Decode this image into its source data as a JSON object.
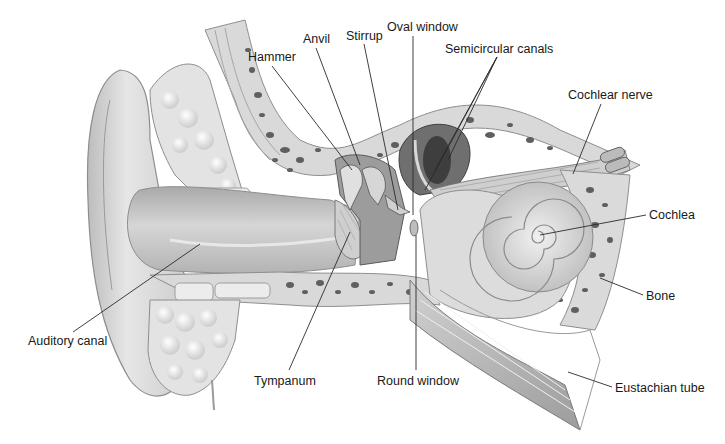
{
  "diagram": {
    "labels": [
      {
        "id": "hammer",
        "text": "Hammer",
        "x": 248,
        "y": 50,
        "line": [
          [
            272,
            66
          ],
          [
            352,
            170
          ]
        ]
      },
      {
        "id": "anvil",
        "text": "Anvil",
        "x": 303,
        "y": 32,
        "line": [
          [
            316,
            48
          ],
          [
            360,
            165
          ]
        ]
      },
      {
        "id": "stirrup",
        "text": "Stirrup",
        "x": 346,
        "y": 29,
        "line": [
          [
            364,
            44
          ],
          [
            398,
            210
          ]
        ]
      },
      {
        "id": "oval-window",
        "text": "Oval window",
        "x": 387,
        "y": 20,
        "line": [
          [
            413,
            36
          ],
          [
            413,
            215
          ]
        ]
      },
      {
        "id": "semicircular-canals",
        "text": "Semicircular canals",
        "x": 445,
        "y": 42,
        "lines": [
          [
            [
              497,
              57
            ],
            [
              435,
              170
            ]
          ],
          [
            [
              497,
              57
            ],
            [
              425,
              190
            ]
          ],
          [
            [
              497,
              57
            ],
            [
              445,
              160
            ]
          ]
        ]
      },
      {
        "id": "cochlear-nerve",
        "text": "Cochlear nerve",
        "x": 568,
        "y": 88,
        "line": [
          [
            601,
            104
          ],
          [
            573,
            174
          ]
        ]
      },
      {
        "id": "cochlea",
        "text": "Cochlea",
        "x": 649,
        "y": 208,
        "line": [
          [
            646,
            215
          ],
          [
            537,
            235
          ]
        ]
      },
      {
        "id": "bone",
        "text": "Bone",
        "x": 646,
        "y": 289,
        "line": [
          [
            643,
            295
          ],
          [
            600,
            278
          ]
        ]
      },
      {
        "id": "eustachian-tube",
        "text": "Eustachian tube",
        "x": 615,
        "y": 381,
        "line": [
          [
            612,
            387
          ],
          [
            568,
            372
          ]
        ]
      },
      {
        "id": "round-window",
        "text": "Round window",
        "x": 377,
        "y": 374,
        "line": [
          [
            416,
            370
          ],
          [
            416,
            235
          ]
        ]
      },
      {
        "id": "tympanum",
        "text": "Tympanum",
        "x": 254,
        "y": 374,
        "line": [
          [
            289,
            370
          ],
          [
            350,
            232
          ]
        ]
      },
      {
        "id": "auditory-canal",
        "text": "Auditory canal",
        "x": 28,
        "y": 334,
        "line": [
          [
            73,
            332
          ],
          [
            200,
            244
          ]
        ]
      }
    ]
  },
  "colors": {
    "background": "#ffffff",
    "tissue_light": "#e4e4e4",
    "tissue_mid": "#c4c4c4",
    "tissue_dark": "#8a8a8a",
    "bone_fill": "#d8d8d8",
    "bone_pore": "#5a5a5a",
    "leader_line": "#2a2a2a",
    "label_text": "#1a1a1a"
  }
}
